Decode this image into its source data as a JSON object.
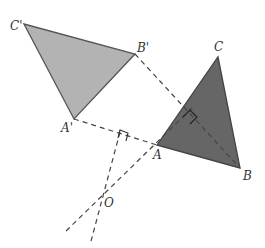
{
  "diagram": {
    "type": "rotation-geometry",
    "triangles": {
      "original": {
        "name": "ABC",
        "fill": "#666666",
        "vertices": {
          "A": [
            157,
            145
          ],
          "B": [
            240,
            168
          ],
          "C": [
            218,
            57
          ]
        }
      },
      "image": {
        "name": "A'B'C'",
        "fill": "#b3b3b3",
        "vertices": {
          "A'": [
            74,
            119
          ],
          "B'": [
            135,
            54
          ],
          "C'": [
            24,
            24
          ]
        }
      }
    },
    "center": {
      "name": "O",
      "point": [
        102,
        198
      ]
    },
    "labels": {
      "A": "A",
      "B": "B",
      "C": "C",
      "A_prime": "A'",
      "B_prime": "B'",
      "C_prime": "C'",
      "O": "O"
    },
    "stroke_color": "#444444"
  }
}
